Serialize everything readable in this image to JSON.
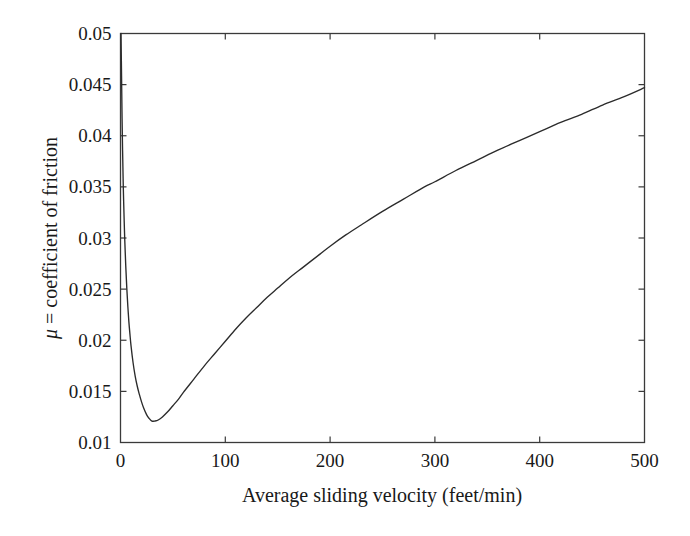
{
  "figure": {
    "background_color": "#ffffff",
    "line_color": "#2b2b2b",
    "axis_color": "#3a3a3a"
  },
  "chart_data": {
    "type": "line",
    "title": "",
    "xlabel": "Average sliding velocity (feet/min)",
    "ylabel": "μ = coefficient of friction",
    "ylabel_symbol": "μ",
    "ylabel_rest": " = coefficient of friction",
    "xlim": [
      0,
      500
    ],
    "ylim": [
      0.01,
      0.05
    ],
    "xticks": [
      0,
      100,
      200,
      300,
      400,
      500
    ],
    "xtick_labels": [
      "0",
      "100",
      "200",
      "300",
      "400",
      "500"
    ],
    "yticks": [
      0.01,
      0.015,
      0.02,
      0.025,
      0.03,
      0.035,
      0.04,
      0.045,
      0.05
    ],
    "ytick_labels": [
      "0.01",
      "0.015",
      "0.02",
      "0.025",
      "0.03",
      "0.035",
      "0.04",
      "0.045",
      "0.05"
    ],
    "grid": false,
    "legend": null,
    "series": [
      {
        "name": "coefficient of friction",
        "x": [
          0.5,
          1,
          1.5,
          2,
          2.5,
          3,
          4,
          5,
          6,
          7,
          8,
          9,
          10,
          12,
          14,
          16,
          18,
          20,
          22,
          25,
          27,
          30,
          33,
          36,
          40,
          45,
          50,
          55,
          60,
          70,
          80,
          90,
          100,
          110,
          120,
          130,
          140,
          150,
          160,
          175,
          190,
          200,
          215,
          230,
          250,
          270,
          290,
          300,
          320,
          340,
          360,
          380,
          400,
          420,
          440,
          460,
          480,
          500
        ],
        "y": [
          0.05,
          0.0459,
          0.0417,
          0.0385,
          0.0358,
          0.0336,
          0.03,
          0.0273,
          0.0251,
          0.0233,
          0.0218,
          0.0206,
          0.0195,
          0.0178,
          0.0165,
          0.0155,
          0.0147,
          0.014,
          0.0134,
          0.0127,
          0.0124,
          0.0121,
          0.0121,
          0.0122,
          0.0125,
          0.013,
          0.0136,
          0.0142,
          0.0149,
          0.0162,
          0.0175,
          0.0187,
          0.0199,
          0.0211,
          0.0222,
          0.0232,
          0.0242,
          0.0251,
          0.026,
          0.0272,
          0.0284,
          0.0292,
          0.0303,
          0.0313,
          0.0326,
          0.0338,
          0.035,
          0.0355,
          0.0366,
          0.0376,
          0.0386,
          0.0395,
          0.0404,
          0.0413,
          0.0421,
          0.043,
          0.0438,
          0.0447
        ]
      }
    ],
    "annotations": {
      "minimum_value": 0.0121,
      "minimum_at_x": 28,
      "start_value": 0.05,
      "end_value": 0.0447
    }
  }
}
